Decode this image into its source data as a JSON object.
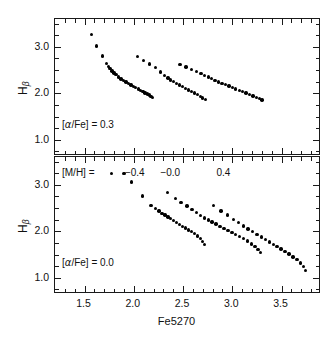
{
  "figure": {
    "xaxis_title": "Fe5270",
    "yaxis_title_base": "H",
    "yaxis_title_sub": "β"
  },
  "panels": {
    "top": {
      "annotation": "[α/Fe] = 0.3",
      "annotation_prefix": "[",
      "annotation_greek": "α",
      "annotation_suffix": "/Fe] = 0.3",
      "ytick_labels": [
        "3.0",
        "2.0",
        "1.0"
      ]
    },
    "bottom": {
      "annotation": "[α/Fe] = 0.0",
      "annotation_prefix": "[",
      "annotation_greek": "α",
      "annotation_suffix": "/Fe] = 0.0",
      "ytick_labels": [
        "3.0",
        "2.0",
        "1.0"
      ]
    }
  },
  "legend": {
    "label": "[M/H] =",
    "values": [
      "−0.4",
      "−0.0",
      "0.4"
    ],
    "marker_color": "#000000"
  },
  "xtick_labels": [
    "1.5",
    "2.0",
    "2.5",
    "3.0",
    "3.5"
  ],
  "chart_data": {
    "type": "scatter",
    "title": "",
    "xlabel": "Fe5270",
    "ylabel": "Hbeta",
    "xlim": [
      1.2,
      3.9
    ],
    "ylim": [
      0.65,
      3.6
    ],
    "xticks": [
      1.5,
      2.0,
      2.5,
      3.0,
      3.5
    ],
    "xticks_minor_step": 0.1,
    "yticks": [
      1.0,
      2.0,
      3.0
    ],
    "yticks_minor_step": 0.25,
    "grid": false,
    "legend_position": "between-panels",
    "marker": "filled-circle",
    "marker_color": "#000000",
    "panels": [
      {
        "id": "top",
        "annotation": "[alpha/Fe] = 0.3",
        "alpha_fe": 0.3,
        "series": [
          {
            "name": "[M/H] = -0.4",
            "x": [
              1.57,
              1.62,
              1.68,
              1.72,
              1.74,
              1.76,
              1.78,
              1.8,
              1.82,
              1.845,
              1.87,
              1.895,
              1.92,
              1.945,
              1.97,
              1.995,
              2.02,
              2.045,
              2.07,
              2.095,
              2.115,
              2.14,
              2.16,
              2.175,
              2.19
            ],
            "y": [
              3.27,
              3.02,
              2.8,
              2.64,
              2.58,
              2.53,
              2.48,
              2.44,
              2.4,
              2.355,
              2.31,
              2.275,
              2.24,
              2.21,
              2.18,
              2.15,
              2.12,
              2.09,
              2.06,
              2.035,
              2.01,
              1.985,
              1.96,
              1.935,
              1.91
            ]
          },
          {
            "name": "[M/H] = -0.0",
            "x": [
              2.04,
              2.1,
              2.16,
              2.22,
              2.27,
              2.31,
              2.345,
              2.375,
              2.405,
              2.435,
              2.465,
              2.495,
              2.525,
              2.555,
              2.585,
              2.615,
              2.645,
              2.675,
              2.7,
              2.725
            ],
            "y": [
              2.79,
              2.71,
              2.63,
              2.55,
              2.46,
              2.385,
              2.33,
              2.29,
              2.25,
              2.215,
              2.18,
              2.145,
              2.11,
              2.075,
              2.04,
              2.005,
              1.97,
              1.935,
              1.9,
              1.865
            ]
          },
          {
            "name": "[M/H] = 0.4",
            "x": [
              2.47,
              2.53,
              2.585,
              2.635,
              2.68,
              2.72,
              2.755,
              2.79,
              2.825,
              2.86,
              2.895,
              2.93,
              2.965,
              3.0,
              3.035,
              3.07,
              3.105,
              3.14,
              3.175,
              3.21,
              3.245,
              3.275,
              3.3
            ],
            "y": [
              2.62,
              2.565,
              2.515,
              2.47,
              2.425,
              2.385,
              2.35,
              2.315,
              2.28,
              2.245,
              2.215,
              2.185,
              2.155,
              2.125,
              2.095,
              2.065,
              2.035,
              2.005,
              1.975,
              1.945,
              1.915,
              1.885,
              1.86
            ]
          }
        ]
      },
      {
        "id": "bottom",
        "annotation": "[alpha/Fe] = 0.0",
        "alpha_fe": 0.0,
        "series": [
          {
            "name": "[M/H] = -0.4",
            "x": [
              1.9,
              1.975,
              2.09,
              2.175,
              2.22,
              2.255,
              2.285,
              2.315,
              2.345,
              2.375,
              2.405,
              2.435,
              2.465,
              2.495,
              2.525,
              2.555,
              2.585,
              2.615,
              2.645,
              2.675,
              2.7,
              2.72
            ],
            "y": [
              3.25,
              3.06,
              2.76,
              2.55,
              2.49,
              2.44,
              2.39,
              2.35,
              2.31,
              2.27,
              2.23,
              2.19,
              2.15,
              2.11,
              2.07,
              2.03,
              1.99,
              1.95,
              1.9,
              1.84,
              1.78,
              1.72
            ]
          },
          {
            "name": "[M/H] = -0.0",
            "x": [
              2.34,
              2.42,
              2.48,
              2.54,
              2.59,
              2.635,
              2.675,
              2.715,
              2.755,
              2.795,
              2.835,
              2.875,
              2.915,
              2.955,
              2.995,
              3.035,
              3.075,
              3.115,
              3.155,
              3.195,
              3.23,
              3.26,
              3.285
            ],
            "y": [
              2.83,
              2.71,
              2.625,
              2.545,
              2.47,
              2.4,
              2.34,
              2.29,
              2.245,
              2.2,
              2.155,
              2.11,
              2.065,
              2.02,
              1.975,
              1.93,
              1.885,
              1.84,
              1.79,
              1.73,
              1.67,
              1.61,
              1.55
            ]
          },
          {
            "name": "[M/H] = 0.4",
            "x": [
              2.81,
              2.885,
              2.95,
              3.01,
              3.065,
              3.115,
              3.16,
              3.205,
              3.25,
              3.295,
              3.335,
              3.375,
              3.415,
              3.455,
              3.495,
              3.535,
              3.575,
              3.615,
              3.655,
              3.69,
              3.72,
              3.745
            ],
            "y": [
              2.55,
              2.44,
              2.35,
              2.26,
              2.185,
              2.115,
              2.05,
              1.99,
              1.93,
              1.875,
              1.82,
              1.77,
              1.72,
              1.67,
              1.62,
              1.565,
              1.51,
              1.45,
              1.39,
              1.32,
              1.24,
              1.16
            ]
          }
        ]
      }
    ]
  }
}
